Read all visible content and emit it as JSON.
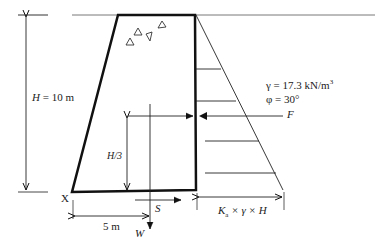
{
  "diagram": {
    "labels": {
      "height": "H = 10 m",
      "height_var": "H",
      "height_val": " = 10 m",
      "h3": "H/3",
      "gamma": "γ = 17.3 kN/m",
      "gamma_exp": "3",
      "phi": "φ = 30°",
      "force_f": "F",
      "force_s": "S",
      "force_w": "W",
      "point_x": "X",
      "base_dim": "5 m",
      "pressure_K": "K",
      "pressure_sub": "a",
      "pressure_rest": " × γ × H"
    },
    "colors": {
      "line": "#111111",
      "text": "#222222",
      "background": "#ffffff"
    }
  }
}
